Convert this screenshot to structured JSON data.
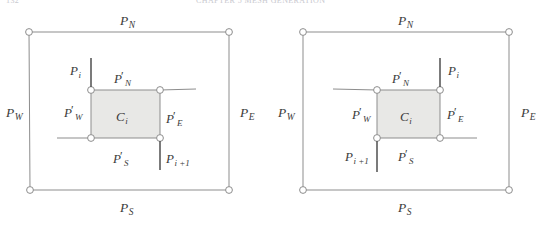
{
  "figure": {
    "header_remnant_left": "132",
    "header_remnant_mid": "CHAPTER 5   MESH GENERATION",
    "background_color": "#ffffff",
    "line_color": "#8d8d8d",
    "stub_color": "#5a5a5a",
    "cell_fill": "#e8e8e6",
    "label_color": "#3b3b3b"
  },
  "panels": [
    {
      "id": "left",
      "name": "patch-diagram-left",
      "outer": {
        "labels": {
          "north": {
            "base": "P",
            "sub": "N"
          },
          "south": {
            "base": "P",
            "sub": "S"
          },
          "west": {
            "base": "P",
            "sub": "W"
          },
          "east": {
            "base": "P",
            "sub": "E"
          }
        }
      },
      "cell": {
        "center_label": {
          "base": "C",
          "sub": "i"
        },
        "labels": {
          "north": {
            "base": "P",
            "sub": "N",
            "prime": "′"
          },
          "south": {
            "base": "P",
            "sub": "S",
            "prime": "′"
          },
          "west": {
            "base": "P",
            "sub": "W",
            "prime": "′"
          },
          "east": {
            "base": "P",
            "sub": "E",
            "prime": "′"
          }
        }
      },
      "stubs": {
        "pi": {
          "base": "P",
          "sub": "i",
          "corner": "top-left",
          "direction": "up"
        },
        "pi_plus": {
          "base": "P",
          "sub": "i +1",
          "corner": "bottom-right",
          "direction": "down"
        }
      }
    },
    {
      "id": "right",
      "name": "patch-diagram-right",
      "outer": {
        "labels": {
          "north": {
            "base": "P",
            "sub": "N"
          },
          "south": {
            "base": "P",
            "sub": "S"
          },
          "west": {
            "base": "P",
            "sub": "W"
          },
          "east": {
            "base": "P",
            "sub": "E"
          }
        }
      },
      "cell": {
        "center_label": {
          "base": "C",
          "sub": "i"
        },
        "labels": {
          "north": {
            "base": "P",
            "sub": "N",
            "prime": "′"
          },
          "south": {
            "base": "P",
            "sub": "S",
            "prime": "′"
          },
          "west": {
            "base": "P",
            "sub": "W",
            "prime": "′"
          },
          "east": {
            "base": "P",
            "sub": "E",
            "prime": "′"
          }
        }
      },
      "stubs": {
        "pi": {
          "base": "P",
          "sub": "i",
          "corner": "top-right",
          "direction": "up"
        },
        "pi_plus": {
          "base": "P",
          "sub": "i +1",
          "corner": "bottom-left",
          "direction": "down"
        }
      }
    }
  ]
}
